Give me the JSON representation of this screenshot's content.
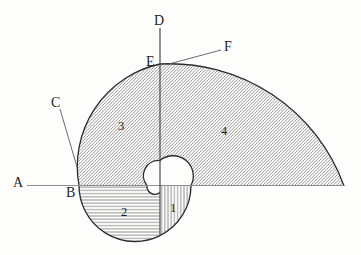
{
  "figure": {
    "points": {
      "a": "A",
      "b": "B",
      "c": "C",
      "d": "D",
      "e": "E",
      "f": "F"
    },
    "regions": {
      "r1": "1",
      "r2": "2",
      "r3": "3",
      "r4": "4"
    },
    "colors": {
      "background": "#fdfdfc",
      "arc_outline": "#2b2b2b",
      "horizontal_line": "#8f8f8f",
      "vertical_line": "#4a4a4a",
      "pointer_line": "#5a5a5a",
      "hatch": "#757575",
      "label_text": "#1d1d1d"
    },
    "hatch_styles": {
      "region_1": "vertical",
      "region_2": "horizontal",
      "region_3": "diagonal",
      "region_4": "diagonal"
    }
  }
}
